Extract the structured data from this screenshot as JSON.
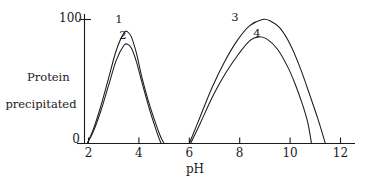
{
  "chart_data": {
    "type": "line",
    "title": "",
    "xlabel": "pH",
    "ylabel_line1": "Protein",
    "ylabel_line2": "precipitated",
    "xlim": [
      1.3,
      12.6
    ],
    "ylim": [
      0,
      108
    ],
    "grid": false,
    "legend_position": "inline-curve-labels",
    "x_ticks": [
      "2",
      "4",
      "6",
      "8",
      "10",
      "12"
    ],
    "x_tick_values": [
      2,
      4,
      6,
      8,
      10,
      12
    ],
    "y_ticks": [
      "0",
      "100"
    ],
    "y_tick_values": [
      0,
      100
    ],
    "series": [
      {
        "name": "1",
        "label": "1",
        "color": "#1a1a1a",
        "x": [
          1.95,
          2.2,
          2.5,
          2.8,
          3.1,
          3.4,
          3.55,
          3.7,
          3.9,
          4.1,
          4.35,
          4.6,
          4.85,
          5.0
        ],
        "values": [
          0,
          12,
          31,
          53,
          75,
          89,
          90,
          86,
          73,
          55,
          36,
          20,
          6,
          0
        ]
      },
      {
        "name": "2",
        "label": "2",
        "color": "#1a1a1a",
        "x": [
          1.95,
          2.2,
          2.5,
          2.8,
          3.1,
          3.4,
          3.55,
          3.7,
          3.9,
          4.15,
          4.4,
          4.6,
          4.75,
          4.88
        ],
        "values": [
          0,
          10,
          27,
          47,
          67,
          79,
          80,
          77,
          66,
          47,
          29,
          16,
          7,
          0
        ]
      },
      {
        "name": "3",
        "label": "3",
        "color": "#1a1a1a",
        "x": [
          6.0,
          6.4,
          6.9,
          7.4,
          7.9,
          8.4,
          8.9,
          9.2,
          9.6,
          10.0,
          10.4,
          10.8,
          11.1,
          11.4
        ],
        "values": [
          0,
          20,
          45,
          66,
          83,
          95,
          100,
          99,
          93,
          80,
          61,
          38,
          20,
          0
        ]
      },
      {
        "name": "4",
        "label": "4",
        "color": "#1a1a1a",
        "x": [
          6.05,
          6.45,
          6.95,
          7.45,
          7.95,
          8.4,
          8.75,
          9.1,
          9.5,
          9.9,
          10.2,
          10.5,
          10.7,
          10.85
        ],
        "values": [
          0,
          17,
          39,
          57,
          72,
          83,
          86,
          84,
          76,
          62,
          48,
          31,
          17,
          0
        ]
      }
    ],
    "curve_labels": [
      {
        "text": "1",
        "near_series": "1"
      },
      {
        "text": "2",
        "near_series": "2"
      },
      {
        "text": "3",
        "near_series": "3"
      },
      {
        "text": "4",
        "near_series": "4"
      }
    ],
    "axis_color": "#1a1a1a"
  }
}
